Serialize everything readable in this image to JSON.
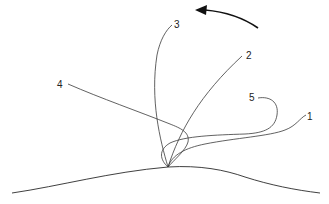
{
  "diagram": {
    "type": "trajectory-diagram",
    "labels": [
      {
        "id": "1",
        "text": "1"
      },
      {
        "id": "2",
        "text": "2"
      },
      {
        "id": "3",
        "text": "3"
      },
      {
        "id": "4",
        "text": "4"
      },
      {
        "id": "5",
        "text": "5"
      }
    ],
    "arrow": {
      "direction": "counter-clockwise",
      "icon": "curved-arrow-left-icon"
    },
    "colors": {
      "stroke": "#3a3a3a",
      "background": "#ffffff"
    }
  }
}
